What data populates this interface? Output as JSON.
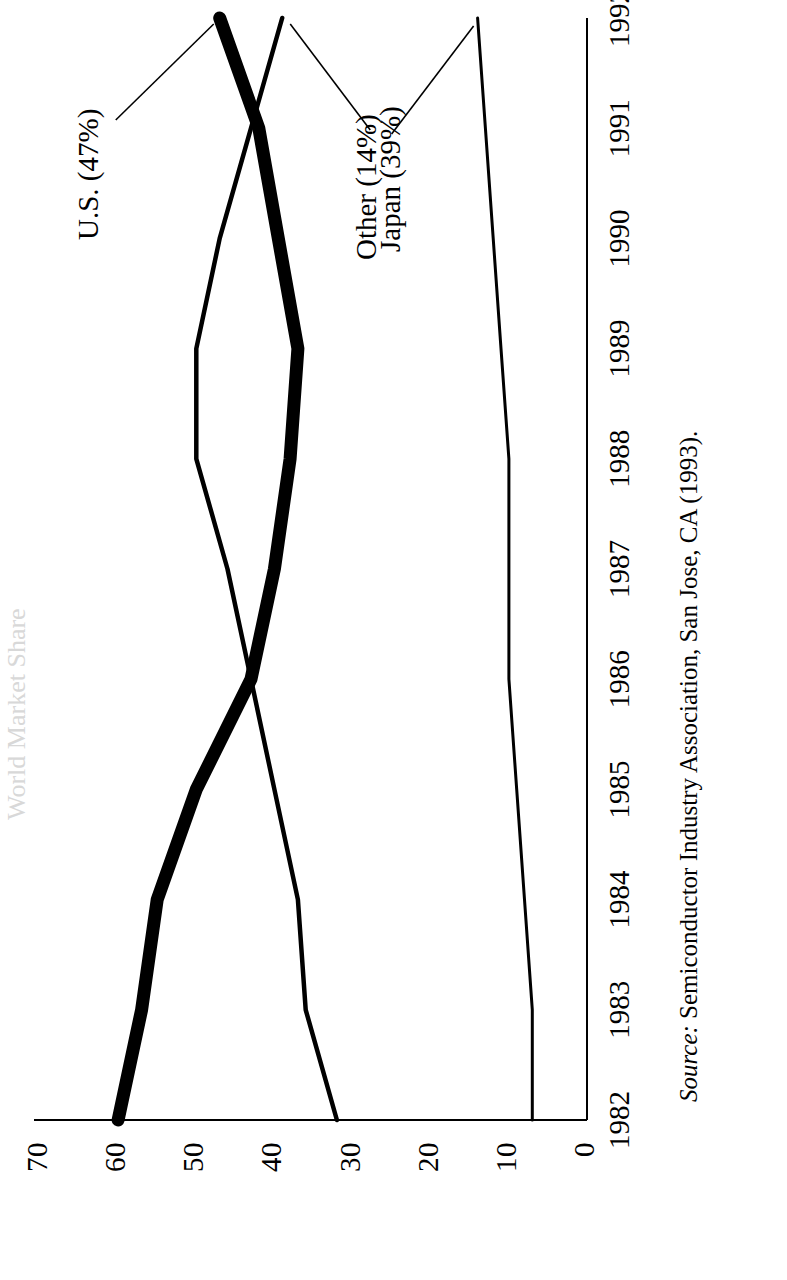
{
  "figure": {
    "title": "World Market Share",
    "source_prefix": "Source:",
    "source_text": "Semiconductor Industry Association, San Jose, CA (1993)."
  },
  "axes": {
    "y_ticks": [
      "70",
      "60",
      "50",
      "40",
      "30",
      "20",
      "10",
      "0"
    ],
    "x_ticks": [
      "1982",
      "1983",
      "1984",
      "1985",
      "1986",
      "1987",
      "1988",
      "1989",
      "1990",
      "1991",
      "1992"
    ]
  },
  "annotations": {
    "us": "U.S. (47%)",
    "japan": "Japan (39%)",
    "other": "Other (14%)"
  },
  "chart_data": {
    "type": "line",
    "title": "World Market Share",
    "xlabel": "",
    "ylabel": "Percent",
    "x": [
      1982,
      1983,
      1984,
      1985,
      1986,
      1987,
      1988,
      1989,
      1990,
      1991,
      1992
    ],
    "xlim": [
      1982,
      1992
    ],
    "ylim": [
      0,
      70
    ],
    "yticks": [
      0,
      10,
      20,
      30,
      40,
      50,
      60,
      70
    ],
    "grid": false,
    "legend": "inline-callouts",
    "series": [
      {
        "name": "U.S.",
        "label": "U.S. (47%)",
        "final_value": 47,
        "style": "thick",
        "values": [
          60,
          57,
          55,
          50,
          43,
          40,
          38,
          37,
          39.5,
          42,
          47
        ]
      },
      {
        "name": "Japan",
        "label": "Japan (39%)",
        "final_value": 39,
        "style": "thin",
        "values": [
          32,
          36,
          37,
          40,
          43,
          46,
          50,
          50,
          47,
          43,
          39
        ]
      },
      {
        "name": "Other",
        "label": "Other (14%)",
        "final_value": 14,
        "style": "thin",
        "values": [
          7,
          7,
          8,
          9,
          10,
          10,
          10,
          11,
          12,
          13,
          14
        ]
      }
    ]
  },
  "colors": {
    "ink": "#000000",
    "paper": "#ffffff"
  }
}
